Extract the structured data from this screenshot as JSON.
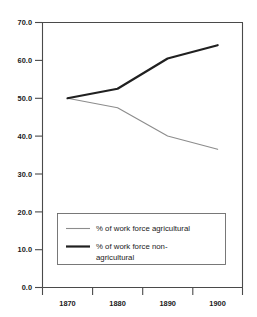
{
  "chart_data": {
    "type": "line",
    "title": "",
    "subtitle": "",
    "xlabel": "",
    "ylabel": "",
    "x": [
      1870,
      1880,
      1890,
      1900
    ],
    "xtick_labels": [
      "1870",
      "1880",
      "1890",
      "1900"
    ],
    "ytick_labels": [
      "0.0",
      "10.0",
      "20.0",
      "30.0",
      "40.0",
      "50.0",
      "60.0",
      "70.0"
    ],
    "ytick_values": [
      0.0,
      10.0,
      20.0,
      30.0,
      40.0,
      50.0,
      60.0,
      70.0
    ],
    "ylim": [
      0.0,
      70.0
    ],
    "grid": false,
    "legend_position": "inside-bottom-center",
    "series": [
      {
        "name": "% of work force agricultural",
        "values": [
          50.0,
          47.5,
          40.0,
          36.5
        ],
        "color": "#8c8c8c",
        "width": 1.1
      },
      {
        "name": "% of work force non-agricultural",
        "values": [
          50.0,
          52.5,
          60.5,
          64.0
        ],
        "color": "#202020",
        "width": 2.2
      }
    ]
  },
  "legend": {
    "entries": [
      {
        "label": "% of work force agricultural",
        "label_line2": ""
      },
      {
        "label": "% of work force non-",
        "label_line2": "agricultural"
      }
    ]
  },
  "axes": {
    "y_labels": [
      "70.0",
      "60.0",
      "50.0",
      "40.0",
      "30.0",
      "20.0",
      "10.0",
      "0.0"
    ],
    "x_labels": [
      "1870",
      "1880",
      "1890",
      "1900"
    ]
  }
}
